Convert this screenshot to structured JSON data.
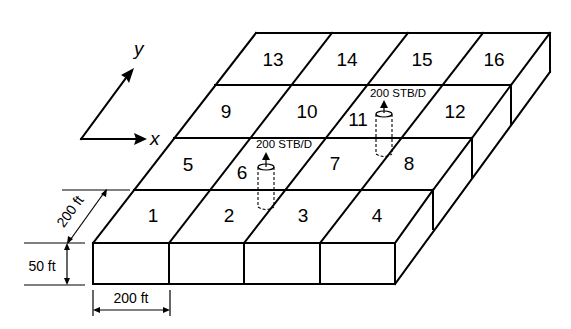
{
  "figure": {
    "grid": {
      "nx": 4,
      "ny": 4
    },
    "cells": [
      {
        "id": "1",
        "label": "1",
        "i": 0,
        "j": 0
      },
      {
        "id": "2",
        "label": "2",
        "i": 1,
        "j": 0
      },
      {
        "id": "3",
        "label": "3",
        "i": 2,
        "j": 0
      },
      {
        "id": "4",
        "label": "4",
        "i": 3,
        "j": 0
      },
      {
        "id": "5",
        "label": "5",
        "i": 0,
        "j": 1
      },
      {
        "id": "6",
        "label": "6",
        "i": 1,
        "j": 1
      },
      {
        "id": "7",
        "label": "7",
        "i": 2,
        "j": 1
      },
      {
        "id": "8",
        "label": "8",
        "i": 3,
        "j": 1
      },
      {
        "id": "9",
        "label": "9",
        "i": 0,
        "j": 2
      },
      {
        "id": "10",
        "label": "10",
        "i": 1,
        "j": 2
      },
      {
        "id": "11",
        "label": "11",
        "i": 2,
        "j": 2
      },
      {
        "id": "12",
        "label": "12",
        "i": 3,
        "j": 2
      },
      {
        "id": "13",
        "label": "13",
        "i": 0,
        "j": 3
      },
      {
        "id": "14",
        "label": "14",
        "i": 1,
        "j": 3
      },
      {
        "id": "15",
        "label": "15",
        "i": 2,
        "j": 3
      },
      {
        "id": "16",
        "label": "16",
        "i": 3,
        "j": 3
      }
    ],
    "wells": [
      {
        "cell": "6",
        "rate_label": "200 STB/D"
      },
      {
        "cell": "11",
        "rate_label": "200 STB/D"
      }
    ],
    "axes": {
      "x_label": "x",
      "y_label": "y"
    },
    "dimensions": {
      "cell_length_x": "200 ft",
      "cell_length_y": "200 ft",
      "thickness": "50 ft"
    }
  }
}
